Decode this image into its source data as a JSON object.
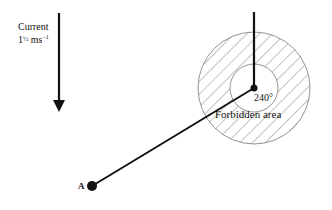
{
  "diagram": {
    "current_label_line1": "Current",
    "current_label_line2_whole": "1",
    "current_label_line2_frac": "½",
    "current_label_line2_unit": " ms",
    "current_label_line2_exp": "−1",
    "angle_label": "240°",
    "region_label": "Forbidden area",
    "point_label": "A",
    "elements": {
      "current_arrow": {
        "x": 59,
        "y1": 13,
        "y2": 112,
        "direction": "down"
      },
      "circle_center": {
        "x": 254,
        "y": 88
      },
      "outer_radius": 56,
      "inner_radius": 24,
      "vertical_line": {
        "x": 254,
        "y1": 12,
        "y2": 88
      },
      "course_line": {
        "from": [
          92,
          186
        ],
        "to": [
          254,
          88
        ]
      },
      "point_A": {
        "x": 92,
        "y": 186
      }
    },
    "colors": {
      "ink": "#111111",
      "hatch": "#777777",
      "background": "#ffffff"
    }
  }
}
